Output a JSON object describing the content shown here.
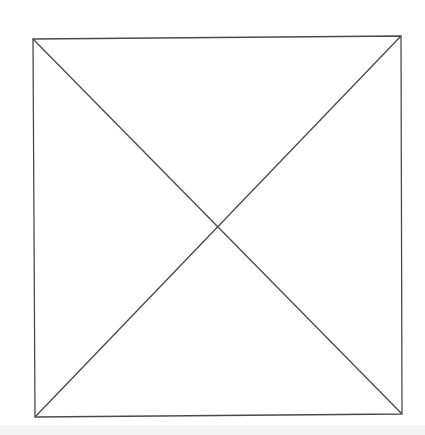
{
  "diagram": {
    "title": "",
    "stroke_color": "#4a4a4a",
    "stroke_width": 1.3,
    "background": "#ffffff",
    "square": {
      "top_left": [
        33,
        39
      ],
      "top_right": [
        401,
        36
      ],
      "bottom_right": [
        402,
        414
      ],
      "bottom_left": [
        35,
        417
      ]
    },
    "diagonals": [
      {
        "from": [
          33,
          39
        ],
        "to": [
          402,
          414
        ]
      },
      {
        "from": [
          401,
          36
        ],
        "to": [
          35,
          417
        ]
      }
    ],
    "intersection": [
      218,
      226
    ]
  }
}
